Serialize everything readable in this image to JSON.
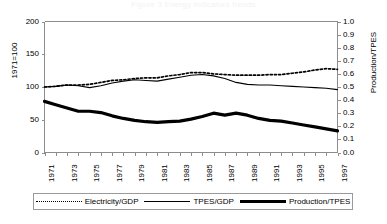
{
  "title": "Figure 3  Energy indicators trends",
  "axes": {
    "left_axis_label": "1971=100",
    "right_axis_label": "Production/TPES",
    "left_ticks": [
      "0",
      "50",
      "100",
      "150",
      "200"
    ],
    "right_ticks": [
      "0.0",
      "0.1",
      "0.2",
      "0.3",
      "0.4",
      "0.5",
      "0.6",
      "0.7",
      "0.8",
      "0.9",
      "1.0"
    ],
    "x_ticks": [
      "1971",
      "1973",
      "1975",
      "1977",
      "1979",
      "1981",
      "1983",
      "1985",
      "1987",
      "1989",
      "1991",
      "1993",
      "1995",
      "1997"
    ]
  },
  "legend": {
    "items": [
      {
        "label": "Electricity/GDP",
        "style": "dotted"
      },
      {
        "label": "TPES/GDP",
        "style": "thin-solid"
      },
      {
        "label": "Production/TPES",
        "style": "thick-solid"
      }
    ]
  },
  "chart_data": {
    "type": "line",
    "title": "Figure 3  Energy indicators trends",
    "xlabel": "",
    "ylabel": "1971=100",
    "y2label": "Production/TPES",
    "xlim": [
      1971,
      1997
    ],
    "ylim": [
      0,
      200
    ],
    "y2lim": [
      0.0,
      1.0
    ],
    "grid": false,
    "legend_position": "bottom",
    "x": [
      1971,
      1972,
      1973,
      1974,
      1975,
      1976,
      1977,
      1978,
      1979,
      1980,
      1981,
      1982,
      1983,
      1984,
      1985,
      1986,
      1987,
      1988,
      1989,
      1990,
      1991,
      1992,
      1993,
      1994,
      1995,
      1996,
      1997
    ],
    "series": [
      {
        "name": "Electricity/GDP",
        "style": "dotted",
        "axis": "left",
        "values": [
          100,
          101,
          103,
          103,
          104,
          107,
          110,
          111,
          113,
          114,
          114,
          117,
          119,
          122,
          122,
          120,
          119,
          118,
          118,
          118,
          119,
          119,
          121,
          123,
          126,
          128,
          127
        ]
      },
      {
        "name": "TPES/GDP",
        "style": "thin-solid",
        "axis": "left",
        "values": [
          100,
          101,
          103,
          102,
          99,
          102,
          106,
          109,
          111,
          110,
          109,
          112,
          115,
          118,
          119,
          117,
          113,
          107,
          104,
          103,
          103,
          102,
          101,
          100,
          99,
          98,
          96
        ]
      },
      {
        "name": "Production/TPES",
        "style": "thick-solid",
        "axis": "left",
        "values": [
          78,
          73,
          68,
          63,
          63,
          61,
          56,
          52,
          49,
          47,
          46,
          47,
          48,
          51,
          55,
          60,
          57,
          60,
          57,
          52,
          49,
          48,
          45,
          42,
          39,
          36,
          33
        ],
        "values_right_axis": [
          0.39,
          0.365,
          0.34,
          0.315,
          0.315,
          0.305,
          0.28,
          0.26,
          0.245,
          0.235,
          0.23,
          0.235,
          0.24,
          0.255,
          0.275,
          0.3,
          0.285,
          0.3,
          0.285,
          0.26,
          0.245,
          0.24,
          0.225,
          0.21,
          0.195,
          0.18,
          0.165
        ]
      }
    ]
  }
}
